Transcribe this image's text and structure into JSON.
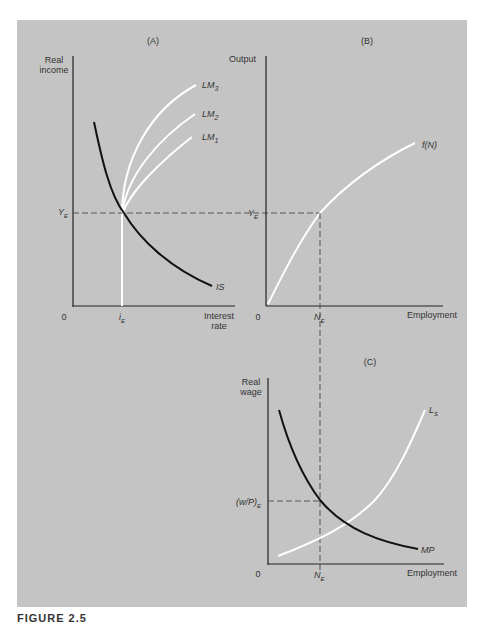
{
  "figure": {
    "caption": "FIGURE 2.5",
    "background": "#c4c4c4",
    "panels": {
      "A": {
        "title": "(A)",
        "y_label_line1": "Real",
        "y_label_line2": "income",
        "x_label_line1": "Interest",
        "x_label_line2": "rate",
        "origin": "0",
        "y_eq": "Y",
        "y_eq_sub": "E",
        "x_eq": "i",
        "x_eq_sub": "E",
        "curves": {
          "lm3": "LM",
          "lm3_sub": "3",
          "lm2": "LM",
          "lm2_sub": "2",
          "lm1": "LM",
          "lm1_sub": "1",
          "is": "IS"
        }
      },
      "B": {
        "title": "(B)",
        "y_label": "Output",
        "x_label": "Employment",
        "origin": "0",
        "y_eq": "Y",
        "y_eq_sub": "E",
        "x_eq": "N",
        "x_eq_sub": "E",
        "curve": "f(N)"
      },
      "C": {
        "title": "(C)",
        "y_label_line1": "Real",
        "y_label_line2": "wage",
        "x_label": "Employment",
        "origin": "0",
        "y_eq": "(w/P)",
        "y_eq_sub": "E",
        "x_eq": "N",
        "x_eq_sub": "E",
        "curves": {
          "ls": "L",
          "ls_sub": "S",
          "mp": "MP"
        }
      }
    }
  }
}
